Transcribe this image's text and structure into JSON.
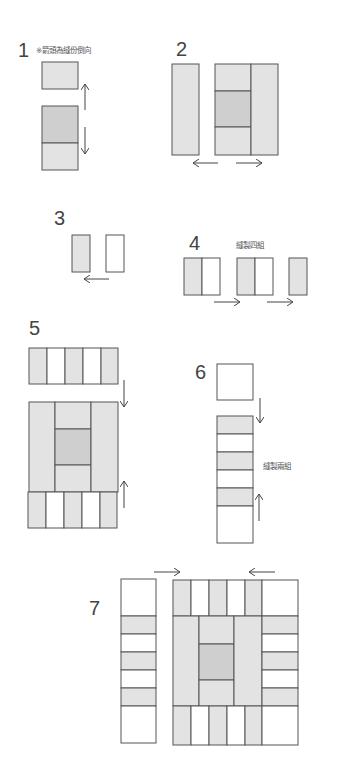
{
  "colors": {
    "light": "#e3e3e3",
    "dark": "#cfcfcf",
    "white": "#ffffff",
    "stroke": "#555555"
  },
  "steps": [
    {
      "number": "1",
      "note": "※箭頭為縫份倒向"
    },
    {
      "number": "2"
    },
    {
      "number": "3"
    },
    {
      "number": "4",
      "note": "縫製四組"
    },
    {
      "number": "5"
    },
    {
      "number": "6",
      "note": "縫製兩組"
    },
    {
      "number": "7"
    }
  ]
}
